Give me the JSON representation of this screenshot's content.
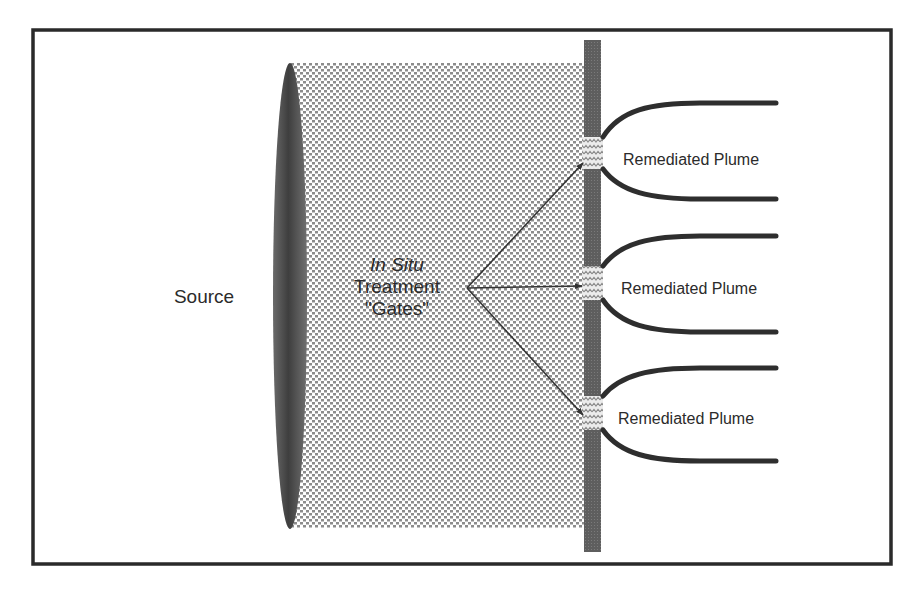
{
  "diagram": {
    "type": "funnel-and-gate schematic",
    "colors": {
      "frame": "#2a2a2a",
      "wall": "#5c5c5c",
      "source_ellipse": "#5a5a5a",
      "plume_fill_dots": "#8a8a8a",
      "plume_lines": "#2e2e2e",
      "arrows": "#333333",
      "text": "#2b2b2b"
    },
    "labels": {
      "source": "Source",
      "gates_line1": "In Situ",
      "gates_line2": "Treatment",
      "gates_line3": "\"Gates\""
    },
    "gates": [
      {
        "id": "gate-1",
        "label": "Remediated Plume"
      },
      {
        "id": "gate-2",
        "label": "Remediated Plume"
      },
      {
        "id": "gate-3",
        "label": "Remediated Plume"
      }
    ]
  }
}
